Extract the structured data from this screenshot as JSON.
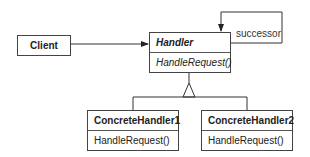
{
  "diagram": {
    "type": "UML class diagram",
    "classes": {
      "client": {
        "name": "Client"
      },
      "handler": {
        "name": "Handler",
        "abstract": true,
        "operations": [
          "HandleRequest()"
        ]
      },
      "concrete1": {
        "name": "ConcreteHandler1",
        "operations": [
          "HandleRequest()"
        ]
      },
      "concrete2": {
        "name": "ConcreteHandler2",
        "operations": [
          "HandleRequest()"
        ]
      }
    },
    "relations": [
      {
        "from": "Client",
        "to": "Handler",
        "type": "association"
      },
      {
        "from": "Handler",
        "to": "Handler",
        "type": "association",
        "label": "successor"
      },
      {
        "from": "ConcreteHandler1",
        "to": "Handler",
        "type": "inheritance"
      },
      {
        "from": "ConcreteHandler2",
        "to": "Handler",
        "type": "inheritance"
      }
    ],
    "successor_label": "successor",
    "line_color": "#333333"
  }
}
